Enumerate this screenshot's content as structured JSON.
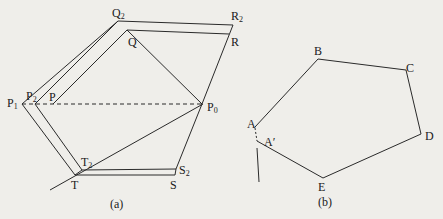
{
  "figure_a": {
    "caption": "(a)",
    "labels": {
      "Q2": {
        "base": "Q",
        "sub": "2"
      },
      "Q": {
        "base": "Q"
      },
      "R2": {
        "base": "R",
        "sub": "2"
      },
      "R": {
        "base": "R"
      },
      "P1": {
        "base": "P",
        "sub": "1"
      },
      "P2": {
        "base": "P",
        "sub": "2"
      },
      "P": {
        "base": "P"
      },
      "P0": {
        "base": "P",
        "sub": "0"
      },
      "T2": {
        "base": "T",
        "sub": "2"
      },
      "T": {
        "base": "T"
      },
      "S2": {
        "base": "S",
        "sub": "2"
      },
      "S": {
        "base": "S"
      }
    }
  },
  "figure_b": {
    "caption": "(b)",
    "labels": {
      "A": "A",
      "A_prime": "A′",
      "B": "B",
      "C": "C",
      "D": "D",
      "E": "E"
    }
  },
  "colors": {
    "background": "#efeeea",
    "stroke": "#2a2a2a"
  }
}
